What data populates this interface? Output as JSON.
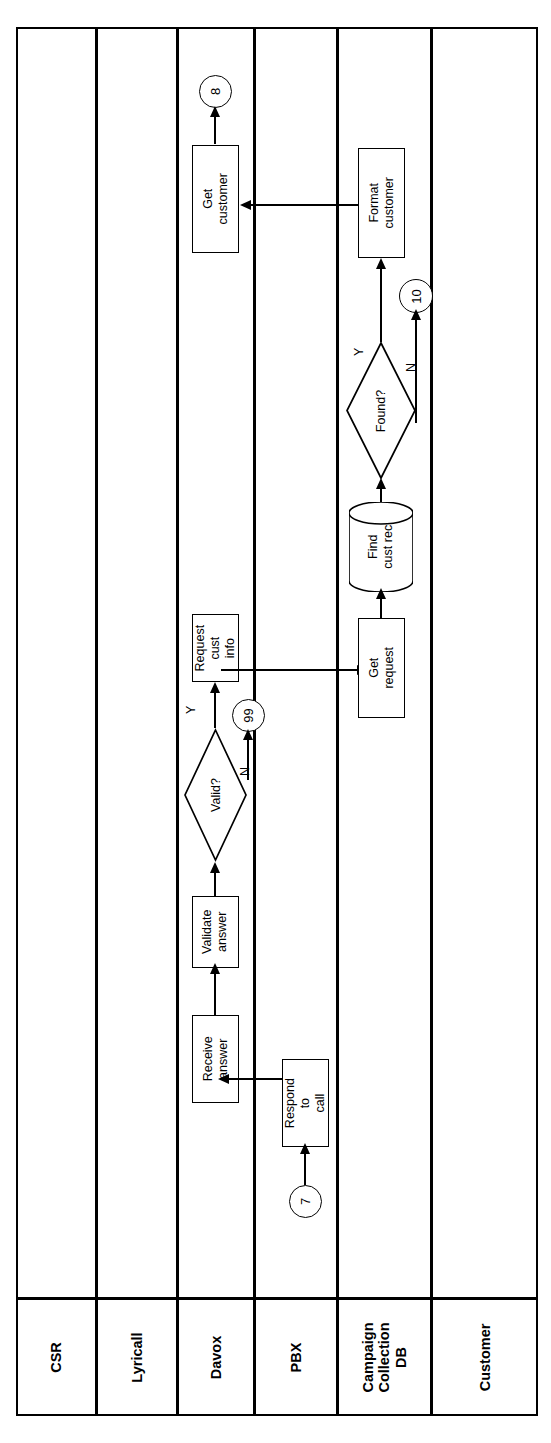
{
  "diagram": {
    "type": "swimlane-flowchart",
    "orientation": "rotated-90-ccw",
    "title": "",
    "lanes": [
      {
        "id": "csr",
        "label": "CSR"
      },
      {
        "id": "lyricall",
        "label": "Lyricall"
      },
      {
        "id": "davox",
        "label": "Davox"
      },
      {
        "id": "pbx",
        "label": "PBX"
      },
      {
        "id": "campaign",
        "label": "Campaign\nCollection\nDB"
      },
      {
        "id": "customer",
        "label": "Customer"
      }
    ],
    "nodes": [
      {
        "id": "get-customer",
        "shape": "process",
        "label": "Get customer",
        "lane": "davox"
      },
      {
        "id": "conn-8",
        "shape": "connector",
        "label": "8",
        "lane": "davox"
      },
      {
        "id": "request-cust-info",
        "shape": "process",
        "label": "Request cust\ninfo",
        "lane": "davox"
      },
      {
        "id": "conn-99",
        "shape": "connector",
        "label": "99",
        "lane": "davox"
      },
      {
        "id": "valid",
        "shape": "decision",
        "label": "Valid?",
        "lane": "davox"
      },
      {
        "id": "validate-answer",
        "shape": "process",
        "label": "Validate\nanswer",
        "lane": "davox"
      },
      {
        "id": "receive-answer",
        "shape": "process",
        "label": "Receive\nanswer",
        "lane": "davox"
      },
      {
        "id": "respond-to-call",
        "shape": "process",
        "label": "Respond to\ncall",
        "lane": "pbx"
      },
      {
        "id": "conn-7",
        "shape": "connector",
        "label": "7",
        "lane": "pbx"
      },
      {
        "id": "format-customer",
        "shape": "process",
        "label": "Format\ncustomer",
        "lane": "campaign"
      },
      {
        "id": "conn-10",
        "shape": "connector",
        "label": "10",
        "lane": "campaign"
      },
      {
        "id": "found",
        "shape": "decision",
        "label": "Found?",
        "lane": "campaign"
      },
      {
        "id": "find-cust-rec",
        "shape": "database",
        "label": "Find\ncust rec",
        "lane": "campaign"
      },
      {
        "id": "get-request",
        "shape": "process",
        "label": "Get request",
        "lane": "campaign"
      }
    ],
    "edges": [
      {
        "from": "conn-7",
        "to": "respond-to-call",
        "label": ""
      },
      {
        "from": "respond-to-call",
        "to": "receive-answer",
        "label": ""
      },
      {
        "from": "receive-answer",
        "to": "validate-answer",
        "label": ""
      },
      {
        "from": "validate-answer",
        "to": "valid",
        "label": ""
      },
      {
        "from": "valid",
        "to": "request-cust-info",
        "label": "Y"
      },
      {
        "from": "valid",
        "to": "conn-99",
        "label": "N"
      },
      {
        "from": "request-cust-info",
        "to": "get-request",
        "label": ""
      },
      {
        "from": "get-request",
        "to": "find-cust-rec",
        "label": ""
      },
      {
        "from": "find-cust-rec",
        "to": "found",
        "label": ""
      },
      {
        "from": "found",
        "to": "format-customer",
        "label": "Y"
      },
      {
        "from": "found",
        "to": "conn-10",
        "label": "N"
      },
      {
        "from": "format-customer",
        "to": "get-customer",
        "label": ""
      },
      {
        "from": "get-customer",
        "to": "conn-8",
        "label": ""
      }
    ],
    "edge_labels": {
      "valid_yes": "Y",
      "valid_no": "N",
      "found_yes": "Y",
      "found_no": "N"
    },
    "colors": {
      "stroke": "#000000",
      "fill": "#ffffff",
      "background": "#ffffff"
    }
  }
}
